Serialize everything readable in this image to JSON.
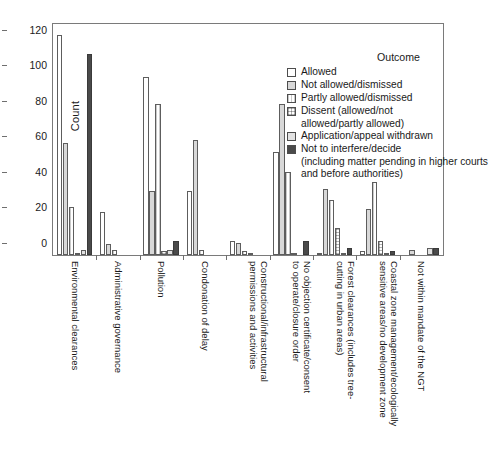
{
  "chart_data": {
    "type": "bar",
    "title": "",
    "xlabel": "",
    "ylabel": "Count",
    "ylim": [
      0,
      130
    ],
    "yticks": [
      0,
      20,
      40,
      60,
      80,
      100,
      120
    ],
    "grid": false,
    "legend_position": "top-right",
    "legend_title": "Outcome",
    "categories": [
      "Environmental clearances",
      "Administrative governance",
      "Pollution",
      "Condonation of delay",
      "Constructional/infrastructural permissions and activities",
      "No objection certificate/consent to operate/closure order",
      "Forest clearances (includes tree-cutting in urban areas)",
      "Coastal zone management/ecologically sensitive areas/no development zone",
      "Not within mandate of the NGT"
    ],
    "series": [
      {
        "name": "Allowed",
        "values": [
          124,
          24,
          100,
          36,
          8,
          58,
          1,
          2,
          0
        ]
      },
      {
        "name": "Not allowed/dismissed",
        "values": [
          63,
          6,
          36,
          65,
          7,
          85,
          37,
          26,
          3
        ]
      },
      {
        "name": "Partly allowed/dismissed",
        "values": [
          27,
          3,
          85,
          3,
          2,
          47,
          31,
          41,
          0
        ]
      },
      {
        "name": "Dissent (allowed/not allowed/partly allowed)",
        "values": [
          1,
          0,
          2,
          0,
          1,
          1,
          15,
          8,
          0
        ]
      },
      {
        "name": "Application/appeal withdrawn",
        "values": [
          3,
          0,
          3,
          0,
          0,
          0,
          1,
          1,
          4
        ]
      },
      {
        "name": "Not to interfere/decide (including matter pending in higher courts and before authorities)",
        "values": [
          113,
          0,
          8,
          0,
          0,
          8,
          4,
          2,
          4
        ]
      }
    ]
  },
  "legend": {
    "title": "Outcome",
    "items": [
      {
        "label": "Allowed",
        "swatch": "empty-white-swatch"
      },
      {
        "label": "Not allowed/dismissed",
        "swatch": "light-gray-swatch"
      },
      {
        "label": "Partly allowed/dismissed",
        "swatch": "vertical-stripe-swatch"
      },
      {
        "label": "Dissent (allowed/not",
        "cont": "allowed/partly allowed)",
        "swatch": "crosshatch-swatch"
      },
      {
        "label": "Application/appeal withdrawn",
        "swatch": "pale-gray-swatch"
      },
      {
        "label": "Not to interfere/decide",
        "cont": "(including matter pending in higher courts and before authorities)",
        "swatch": "dark-gray-swatch"
      }
    ]
  },
  "axes": {
    "y_title": "Count",
    "y_ticks": [
      "0",
      "20",
      "40",
      "60",
      "80",
      "100",
      "120"
    ],
    "x_labels": [
      {
        "lines": [
          "Environmental clearances"
        ]
      },
      {
        "lines": [
          "Administrative governance"
        ]
      },
      {
        "lines": [
          "Pollution"
        ]
      },
      {
        "lines": [
          "Condonation of delay"
        ]
      },
      {
        "lines": [
          "Constructional/infrastructural",
          "permissions and activities"
        ]
      },
      {
        "lines": [
          "No objection certificate/consent",
          "to operate/closure order"
        ]
      },
      {
        "lines": [
          "Forest clearances (includes tree-",
          "cutting in urban areas)"
        ]
      },
      {
        "lines": [
          "Coastal zone management/ecologically",
          "sensitive areas/no development zone"
        ]
      },
      {
        "lines": [
          "Not within mandate of the NGT"
        ]
      }
    ]
  },
  "colors": {
    "allowed": "#ffffff",
    "not_allowed": "#d8d8d8",
    "partly_allowed": "#c9c9c9",
    "dissent": "#b5b5b5",
    "withdrawn": "#e2e2e2",
    "not_interfere": "#4a4a4a",
    "axis": "#7a7a7a",
    "text": "#1a1a1a"
  }
}
